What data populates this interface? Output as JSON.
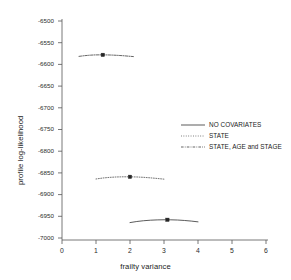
{
  "chart_data": {
    "type": "line",
    "title": "",
    "xlabel": "frailty variance",
    "ylabel": "profile log-likelihood",
    "xlim": [
      0,
      6
    ],
    "ylim": [
      -7000,
      -6500
    ],
    "xticks": [
      "0",
      "1",
      "2",
      "3",
      "4",
      "5",
      "6"
    ],
    "yticks": [
      "-6500",
      "-6550",
      "-6600",
      "-6650",
      "-6700",
      "-6750",
      "-6800",
      "-6850",
      "-6900",
      "-6950",
      "-7000"
    ],
    "grid": false,
    "legend_position": "center-right",
    "series": [
      {
        "name": "NO COVARIATES",
        "linestyle": "solid",
        "color": "#3d3d3d",
        "marker": "square",
        "marker_x": 3.1,
        "marker_y": -6958,
        "x": [
          2.0,
          2.2,
          2.4,
          2.6,
          2.8,
          3.0,
          3.1,
          3.2,
          3.4,
          3.6,
          3.8,
          4.0
        ],
        "y": [
          -6964.5,
          -6962.0,
          -6960.2,
          -6959.0,
          -6958.3,
          -6958.0,
          -6958.0,
          -6958.1,
          -6958.6,
          -6959.6,
          -6961.0,
          -6962.8
        ]
      },
      {
        "name": "STATE",
        "linestyle": "dotted",
        "color": "#5a5a5a",
        "marker": "square",
        "marker_x": 2.0,
        "marker_y": -6859,
        "x": [
          1.0,
          1.2,
          1.4,
          1.6,
          1.8,
          2.0,
          2.2,
          2.4,
          2.6,
          2.8,
          3.0
        ],
        "y": [
          -6864.0,
          -6861.8,
          -6860.3,
          -6859.4,
          -6859.0,
          -6859.0,
          -6859.4,
          -6860.2,
          -6861.4,
          -6862.8,
          -6864.4
        ]
      },
      {
        "name": "STATE, AGE and STAGE",
        "linestyle": "dashdot",
        "color": "#4a4a4a",
        "marker": "square",
        "marker_x": 1.2,
        "marker_y": -6578,
        "x": [
          0.5,
          0.65,
          0.8,
          0.95,
          1.1,
          1.2,
          1.35,
          1.5,
          1.65,
          1.8,
          1.95,
          2.1
        ],
        "y": [
          -6581.5,
          -6580.0,
          -6578.9,
          -6578.2,
          -6578.0,
          -6578.0,
          -6578.2,
          -6578.6,
          -6579.2,
          -6580.0,
          -6581.0,
          -6582.0
        ]
      }
    ]
  },
  "legend": {
    "items": [
      {
        "label": "NO COVARIATES"
      },
      {
        "label": "STATE"
      },
      {
        "label": "STATE, AGE and STAGE"
      }
    ]
  },
  "axes": {
    "x_title": "frailty variance",
    "y_title": "profile log-likelihood"
  }
}
